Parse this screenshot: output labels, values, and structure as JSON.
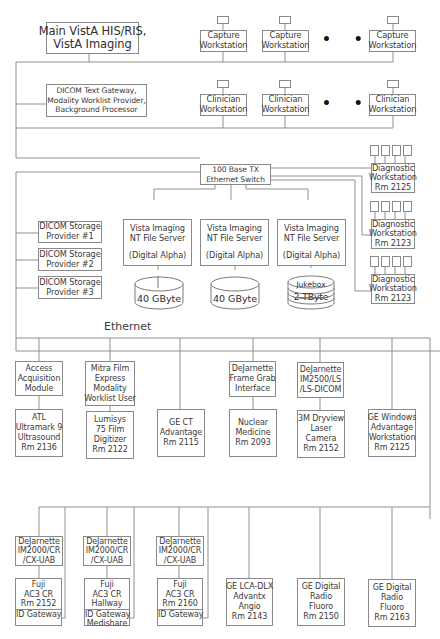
{
  "diagram": {
    "top": {
      "main_system": [
        "Main VistA HIS/RIS,",
        "VistA Imaging"
      ],
      "gateway": [
        "DICOM Text Gateway,",
        "Modality Worklist Provider,",
        "Background Processor"
      ],
      "capture_workstations": [
        [
          "Capture",
          "Workstation"
        ],
        [
          "Capture",
          "Workstation"
        ],
        [
          "Capture",
          "Workstation"
        ]
      ],
      "clinician_workstations": [
        [
          "Clinician",
          "Workstation"
        ],
        [
          "Clinician",
          "Workstation"
        ],
        [
          "Clinician",
          "Workstation"
        ]
      ],
      "ellipsis": "• • •"
    },
    "switch": [
      "100 Base TX",
      "Ethernet Switch"
    ],
    "storage_providers": [
      [
        "DICOM Storage",
        "Provider #1"
      ],
      [
        "DICOM Storage",
        "Provider #2"
      ],
      [
        "DICOM Storage",
        "Provider #3"
      ]
    ],
    "file_servers": [
      {
        "lines": [
          "Vista Imaging",
          "NT File Server",
          "",
          "(Digital Alpha)"
        ],
        "disk": "40 GByte"
      },
      {
        "lines": [
          "Vista Imaging",
          "NT File Server",
          "",
          "(Digital Alpha)"
        ],
        "disk": "40 GByte"
      },
      {
        "lines": [
          "Vista Imaging",
          "NT File Server",
          "",
          "(Digital Alpha)"
        ],
        "disk_top": "Jukebox",
        "disk": "2 TByte"
      }
    ],
    "diagnostic_workstations": [
      [
        "Diagnostic",
        "Workstation",
        "Rm 2125"
      ],
      [
        "Diagnostic",
        "Workstation",
        "Rm 2123"
      ],
      [
        "Diagnostic",
        "Workstation",
        "Rm 2123"
      ]
    ],
    "ethernet_label": "Ethernet",
    "interfaces": [
      [
        "Access",
        "Acquisition",
        "Module"
      ],
      [
        "Mitra Film",
        "Express",
        "Modality",
        "Worklist User"
      ],
      [
        "DeJarnette",
        "Frame Grab",
        "Interface"
      ],
      [
        "DeJarnette",
        "IM2500/LS",
        "/LS-DICOM"
      ]
    ],
    "modalities_row1": [
      [
        "ATL",
        "Ultramark 9",
        "Ultrasound",
        "Rm 2136"
      ],
      [
        "Lumisys",
        "75 Film",
        "Digitizer",
        "Rm 2122"
      ],
      [
        "GE CT",
        "Advantage",
        "Rm 2115"
      ],
      [
        "Nuclear",
        "Medicine",
        "Rm 2093"
      ],
      [
        "3M Dryview",
        "Laser",
        "Camera",
        "Rm 2152"
      ],
      [
        "GE Windows",
        "Advantage",
        "Workstation",
        "Rm 2125"
      ]
    ],
    "cr_interfaces": [
      [
        "DeJarnette",
        "IM2000/CR",
        "/CX-UAB"
      ],
      [
        "DeJarnette",
        "IM2000/CR",
        "/CX-UAB"
      ],
      [
        "DeJarnette",
        "IM2000/CR",
        "/CX-UAB"
      ]
    ],
    "cr_units": [
      {
        "lines": [
          "Fuji",
          "AC3 CR",
          "Rm 2152"
        ],
        "gateway": [
          "ID Gateway"
        ]
      },
      {
        "lines": [
          "Fuji",
          "AC3 CR",
          "Hallway"
        ],
        "gateway": [
          "ID Gateway",
          "Medishare"
        ]
      },
      {
        "lines": [
          "Fuji",
          "AC3 CR",
          "Rm 2160"
        ],
        "gateway": [
          "ID Gateway"
        ]
      }
    ],
    "modalities_row2": [
      [
        "GE LCA-DLX",
        "Advantx",
        "Angio",
        "Rm 2143"
      ],
      [
        "GE Digital",
        "Radio",
        "Fluoro",
        "Rm 2150"
      ],
      [
        "GE Digital",
        "Radio",
        "Fluoro",
        "Rm 2163"
      ]
    ]
  }
}
